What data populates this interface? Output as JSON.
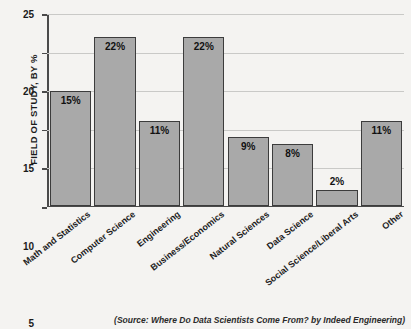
{
  "chart_data": {
    "type": "bar",
    "title": "",
    "xlabel": "",
    "ylabel": "FIELD OF STUDY, BY %",
    "ylim": [
      0,
      25
    ],
    "yticks": [
      0,
      5,
      10,
      15,
      20,
      25
    ],
    "ytick_labels": [
      "0",
      "5",
      "10",
      "15",
      "20",
      "25"
    ],
    "grid": true,
    "legend": false,
    "categories": [
      "Math and Statistics",
      "Computer Science",
      "Engineering",
      "Business/Economics",
      "Natural Sciences",
      "Data Science",
      "Social Science/Liberal Arts",
      "Other"
    ],
    "values": [
      15,
      22,
      11,
      22,
      9,
      8,
      2,
      11
    ],
    "data_labels": [
      "15%",
      "22%",
      "11%",
      "22%",
      "9%",
      "8%",
      "2%",
      "11%"
    ],
    "label_position": [
      "inside",
      "inside",
      "inside",
      "inside",
      "inside",
      "inside",
      "outside",
      "inside"
    ],
    "bar_color": "#a9a9a9",
    "bar_edge_color": "#3c3c3c",
    "grid_color": "#c9c9c7",
    "axis_color": "#4a4a4a",
    "background_color": "#f4f3f1"
  },
  "caption": {
    "source": "(Source: Where Do Data Scientists Come From? by Indeed Engineering)"
  }
}
